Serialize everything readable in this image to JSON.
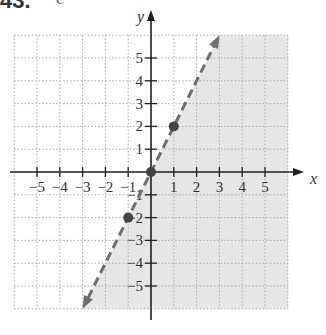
{
  "header": {
    "problem_number": "43.",
    "cropped_glyph": "c"
  },
  "chart_data": {
    "type": "line",
    "title": "",
    "xlabel": "x",
    "ylabel": "y",
    "xlim": [
      -6,
      6
    ],
    "ylim": [
      -6,
      6
    ],
    "grid": true,
    "x_ticks": [
      -5,
      -4,
      -3,
      -2,
      -1,
      1,
      2,
      3,
      4,
      5
    ],
    "y_ticks": [
      5,
      4,
      3,
      2,
      1,
      -1,
      -2,
      -3,
      -4,
      -5
    ],
    "x_tick_labels": [
      "−5",
      "−4",
      "−3",
      "−2",
      "−1",
      "1",
      "2",
      "3",
      "4",
      "5"
    ],
    "y_tick_labels": [
      "5",
      "4",
      "3",
      "2",
      "1",
      "−1",
      "−2",
      "−3",
      "−4",
      "−5"
    ],
    "boundary_line": {
      "equation": "y = 2x",
      "style": "dashed",
      "arrows": "both",
      "from": [
        -3,
        -6
      ],
      "to": [
        3,
        6
      ]
    },
    "points": [
      {
        "x": -1,
        "y": -2
      },
      {
        "x": 0,
        "y": 0
      },
      {
        "x": 1,
        "y": 2
      }
    ],
    "shaded_region": "right of line (y < 2x)",
    "colors": {
      "shade": "#e6e6e6",
      "line": "#6e6e6e",
      "axis": "#222222",
      "grid": "#a8a8a8"
    }
  }
}
